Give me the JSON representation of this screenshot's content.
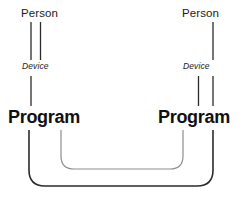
{
  "diagram": {
    "type": "node-link-diagram",
    "title": "",
    "background_color": "#ffffff",
    "stroke_color": "#2b2b2b",
    "stroke_color_light": "#8e8e8e",
    "text_color": "#1a1a1a",
    "left_branch": {
      "person_label": "Person",
      "device_label": "Device",
      "program_label": "Program"
    },
    "right_branch": {
      "person_label": "Person",
      "device_label": "Device",
      "program_label": "Program"
    },
    "connectors": {
      "outer_loop_name": "outer-connector",
      "inner_loop_name": "inner-connector"
    }
  }
}
